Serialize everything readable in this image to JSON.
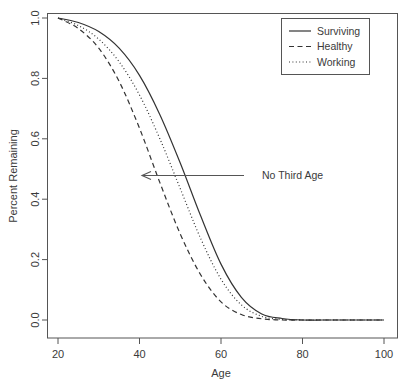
{
  "chart_data": {
    "type": "line",
    "title": "",
    "xlabel": "Age",
    "ylabel": "Percent Remaining",
    "xlim": [
      20,
      100
    ],
    "ylim": [
      0.0,
      1.0
    ],
    "grid": false,
    "legend_position": "top-right",
    "xticks": [
      "20",
      "40",
      "60",
      "80",
      "100"
    ],
    "xtick_values": [
      20,
      40,
      60,
      80,
      100
    ],
    "yticks": [
      "0.0",
      "0.2",
      "0.4",
      "0.6",
      "0.8",
      "1.0"
    ],
    "ytick_values": [
      0.0,
      0.2,
      0.4,
      0.6,
      0.8,
      1.0
    ],
    "x": [
      20,
      25,
      30,
      35,
      40,
      45,
      50,
      55,
      60,
      65,
      70,
      75,
      80,
      85,
      90,
      95,
      100
    ],
    "series": [
      {
        "name": "Surviving",
        "style": "solid",
        "values": [
          1.0,
          0.985,
          0.955,
          0.9,
          0.81,
          0.68,
          0.52,
          0.345,
          0.185,
          0.075,
          0.02,
          0.005,
          0.0,
          0.0,
          0.0,
          0.0,
          0.0
        ]
      },
      {
        "name": "Healthy",
        "style": "dashed",
        "values": [
          1.0,
          0.965,
          0.9,
          0.79,
          0.635,
          0.455,
          0.285,
          0.15,
          0.06,
          0.018,
          0.004,
          0.0,
          0.0,
          0.0,
          0.0,
          0.0,
          0.0
        ]
      },
      {
        "name": "Working",
        "style": "dotted",
        "values": [
          1.0,
          0.975,
          0.93,
          0.855,
          0.745,
          0.6,
          0.435,
          0.27,
          0.135,
          0.05,
          0.012,
          0.002,
          0.0,
          0.0,
          0.0,
          0.0,
          0.0
        ]
      }
    ],
    "annotations": [
      {
        "text": "No Third Age",
        "arrow_from_x": 60,
        "arrow_to_x": 41,
        "arrow_y": 0.49
      }
    ]
  },
  "legend": {
    "entries": [
      {
        "label": "Surviving"
      },
      {
        "label": "Healthy"
      },
      {
        "label": "Working"
      }
    ]
  },
  "axes": {
    "x_title": "Age",
    "y_title": "Percent Remaining",
    "x_tick_labels": [
      "20",
      "40",
      "60",
      "80",
      "100"
    ],
    "y_tick_labels": [
      "0.0",
      "0.2",
      "0.4",
      "0.6",
      "0.8",
      "1.0"
    ]
  },
  "annotation": {
    "text": "No Third Age"
  },
  "colors": {
    "line": "#333333",
    "axis": "#555555",
    "text": "#3a3a3a",
    "background": "#ffffff"
  }
}
